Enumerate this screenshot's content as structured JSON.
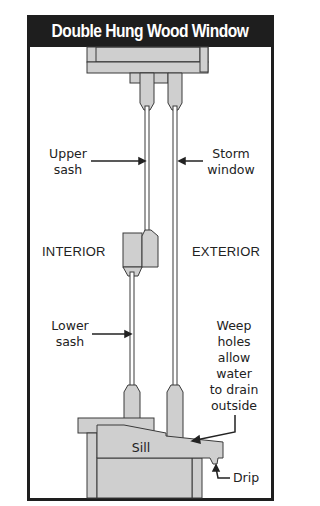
{
  "title": "Double Hung Wood Window",
  "labels": {
    "upper_sash": [
      "Upper",
      "sash"
    ],
    "storm_window": [
      "Storm",
      "window"
    ],
    "interior": "INTERIOR",
    "exterior": "EXTERIOR",
    "lower_sash": [
      "Lower",
      "sash"
    ],
    "weep_holes": [
      "Weep",
      "holes",
      "allow",
      "water",
      "to drain",
      "outside"
    ],
    "sill": "Sill",
    "drip": "Drip"
  },
  "colors": {
    "frame": "#1e1e1e",
    "wood": "#cfcfcf",
    "outline": "#3a3a3a",
    "background": "#ffffff"
  }
}
